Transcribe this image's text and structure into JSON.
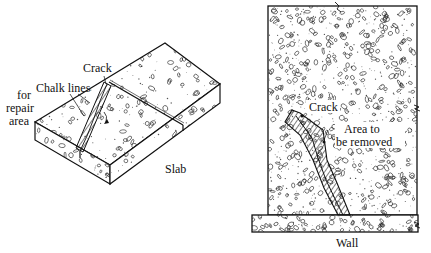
{
  "figures": [
    {
      "id": "slab",
      "caption": "Slab",
      "labels": {
        "crack": "Crack",
        "chalk_lines": "Chalk lines",
        "for_repair_area_line1": "for",
        "for_repair_area_line2": "repair",
        "for_repair_area_line3": "area"
      }
    },
    {
      "id": "wall",
      "caption": "Wall",
      "labels": {
        "crack": "Crack",
        "area_line1": "Area to",
        "area_line2": "be removed"
      }
    }
  ],
  "colors": {
    "ink": "#111111",
    "concrete_fill": "#ffffff",
    "speckle": "#555555"
  }
}
